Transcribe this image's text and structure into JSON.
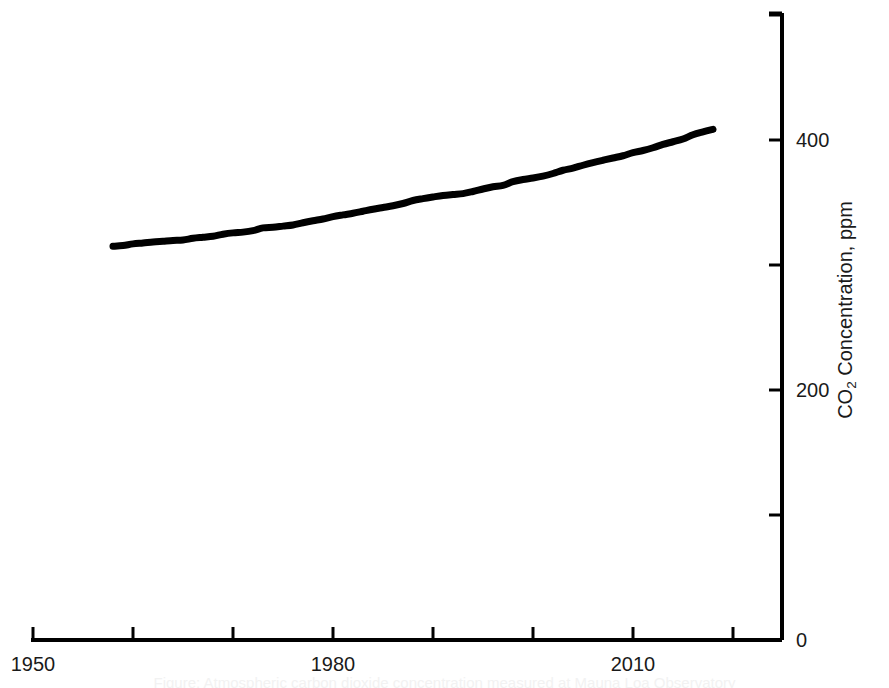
{
  "chart_data": {
    "type": "line",
    "title": "",
    "xlabel": "",
    "ylabel": "CO2 Concentration, ppm",
    "ylabel_parts": {
      "prefix": "CO",
      "subscript": "2",
      "suffix": " Concentration, ppm"
    },
    "xlim": [
      1950,
      2020
    ],
    "ylim": [
      0,
      512
    ],
    "grid": false,
    "legend": null,
    "y_axis_position": "right",
    "x_tick_values": [
      1950,
      1960,
      1970,
      1980,
      1990,
      2000,
      2010,
      2020
    ],
    "x_tick_labels": [
      "1950",
      "",
      "",
      "1980",
      "",
      "",
      "2010",
      ""
    ],
    "y_tick_values": [
      0,
      100,
      200,
      300,
      400,
      500
    ],
    "y_tick_labels": [
      "0",
      "",
      "200",
      "",
      "400",
      ""
    ],
    "series": [
      {
        "name": "Atmospheric CO2 (Mauna Loa)",
        "color": "#000000",
        "line_width": 7,
        "x": [
          1958,
          1959,
          1960,
          1961,
          1962,
          1963,
          1964,
          1965,
          1966,
          1967,
          1968,
          1969,
          1970,
          1971,
          1972,
          1973,
          1974,
          1975,
          1976,
          1977,
          1978,
          1979,
          1980,
          1981,
          1982,
          1983,
          1984,
          1985,
          1986,
          1987,
          1988,
          1989,
          1990,
          1991,
          1992,
          1993,
          1994,
          1995,
          1996,
          1997,
          1998,
          1999,
          2000,
          2001,
          2002,
          2003,
          2004,
          2005,
          2006,
          2007,
          2008,
          2009,
          2010,
          2011,
          2012,
          2013,
          2014,
          2015,
          2016,
          2017,
          2018
        ],
        "values": [
          315.0,
          315.6,
          316.9,
          317.6,
          318.4,
          319.0,
          319.6,
          320.0,
          321.4,
          322.2,
          323.0,
          324.6,
          325.7,
          326.3,
          327.5,
          329.7,
          330.2,
          331.1,
          332.0,
          333.8,
          335.4,
          336.8,
          338.7,
          340.1,
          341.4,
          343.0,
          344.6,
          346.0,
          347.4,
          349.2,
          351.6,
          353.1,
          354.4,
          355.6,
          356.4,
          357.1,
          358.8,
          360.8,
          362.6,
          363.7,
          366.7,
          368.4,
          369.6,
          371.1,
          373.2,
          375.8,
          377.5,
          379.8,
          381.9,
          383.8,
          385.6,
          387.4,
          389.9,
          391.6,
          393.8,
          396.5,
          398.6,
          400.8,
          404.2,
          406.5,
          408.5
        ]
      }
    ],
    "caption": "Figure: Atmospheric carbon dioxide concentration measured at Mauna Loa Observatory"
  },
  "axis_style": {
    "axis_color": "#000000",
    "axis_line_width": 4,
    "tick_line_width": 3,
    "tick_length": 13
  }
}
